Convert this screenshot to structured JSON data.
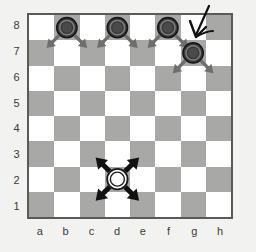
{
  "board": {
    "size": 8,
    "light_color": "#ffffff",
    "dark_color": "#a8a8a6",
    "border_color": "#5a5a58",
    "background_color": "#f2f2f0",
    "file_labels": [
      "a",
      "b",
      "c",
      "d",
      "e",
      "f",
      "g",
      "h"
    ],
    "rank_labels": [
      "8",
      "7",
      "6",
      "5",
      "4",
      "3",
      "2",
      "1"
    ],
    "dark_square_rule": "dark when (file_index + rank_index) is odd"
  },
  "pieces": [
    {
      "id": "black-piece-b8",
      "square": "b8",
      "file": "b",
      "rank": 8,
      "color": "black",
      "fill": "#3a3a3a",
      "ring": "#8a8a8a"
    },
    {
      "id": "black-piece-d8",
      "square": "d8",
      "file": "d",
      "rank": 8,
      "color": "black",
      "fill": "#3a3a3a",
      "ring": "#8a8a8a"
    },
    {
      "id": "black-piece-f8",
      "square": "f8",
      "file": "f",
      "rank": 8,
      "color": "black",
      "fill": "#3a3a3a",
      "ring": "#8a8a8a"
    },
    {
      "id": "black-piece-g7",
      "square": "g7",
      "file": "g",
      "rank": 7,
      "color": "black",
      "fill": "#3a3a3a",
      "ring": "#8a8a8a"
    },
    {
      "id": "white-piece-d2",
      "square": "d2",
      "file": "d",
      "rank": 2,
      "color": "white",
      "fill": "#ffffff",
      "ring": "#1a1a1a"
    }
  ],
  "move_arrows": [
    {
      "id": "arrow-b8-to-a7",
      "from": "b8",
      "to": "a7",
      "direction": "down-left",
      "color": "#6e6e6c",
      "style": "thin"
    },
    {
      "id": "arrow-b8-to-c7",
      "from": "b8",
      "to": "c7",
      "direction": "down-right",
      "color": "#6e6e6c",
      "style": "thin"
    },
    {
      "id": "arrow-d8-to-c7",
      "from": "d8",
      "to": "c7",
      "direction": "down-left",
      "color": "#6e6e6c",
      "style": "thin"
    },
    {
      "id": "arrow-d8-to-e7",
      "from": "d8",
      "to": "e7",
      "direction": "down-right",
      "color": "#6e6e6c",
      "style": "thin"
    },
    {
      "id": "arrow-f8-to-e7",
      "from": "f8",
      "to": "e7",
      "direction": "down-left",
      "color": "#6e6e6c",
      "style": "thin"
    },
    {
      "id": "arrow-f8-to-g7",
      "from": "f8",
      "to": "g7",
      "direction": "down-right",
      "color": "#6e6e6c",
      "style": "thin"
    },
    {
      "id": "arrow-g7-to-f6",
      "from": "g7",
      "to": "f6",
      "direction": "down-left",
      "color": "#6e6e6c",
      "style": "thin"
    },
    {
      "id": "arrow-g7-to-h6",
      "from": "g7",
      "to": "h6",
      "direction": "down-right",
      "color": "#6e6e6c",
      "style": "thin"
    },
    {
      "id": "arrow-d2-to-c3",
      "from": "d2",
      "to": "c3",
      "direction": "up-left",
      "color": "#111111",
      "style": "thick"
    },
    {
      "id": "arrow-d2-to-e3",
      "from": "d2",
      "to": "e3",
      "direction": "up-right",
      "color": "#111111",
      "style": "thick"
    },
    {
      "id": "arrow-d2-to-c1",
      "from": "d2",
      "to": "c1",
      "direction": "down-left",
      "color": "#111111",
      "style": "thick"
    },
    {
      "id": "arrow-d2-to-e1",
      "from": "d2",
      "to": "e1",
      "direction": "down-right",
      "color": "#111111",
      "style": "thick"
    }
  ],
  "annotation": {
    "id": "hand-drawn-pointer",
    "label": "pointer arrow",
    "points_to": "g7",
    "color": "#111111"
  }
}
